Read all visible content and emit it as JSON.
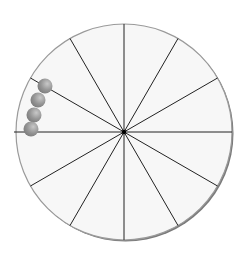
{
  "diagram": {
    "title": "",
    "center": {
      "x": 124,
      "y": 132
    },
    "radius": 108,
    "sectors": 12,
    "colors": {
      "disc_fill": "#f7f7f7",
      "disc_edge": "#9a9a9a",
      "disc_shadow": "#7a7a7a",
      "spoke": "#222222",
      "ball": "#8e8e8e",
      "ball_highlight": "#c4c4c4"
    },
    "balls": [
      {
        "x": 45,
        "y": 86,
        "r": 7.5
      },
      {
        "x": 38,
        "y": 100,
        "r": 7.5
      },
      {
        "x": 34,
        "y": 115,
        "r": 7.5
      },
      {
        "x": 31,
        "y": 129,
        "r": 7.5
      }
    ]
  }
}
